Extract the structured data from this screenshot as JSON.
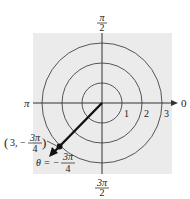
{
  "diagram": {
    "type": "polar-coordinate-plot",
    "background_color": "#ebebeb",
    "axis_color": "#333333",
    "circle_color": "#555555",
    "ray_color": "#111111",
    "center": {
      "x": 102,
      "y": 103
    },
    "unit_px": 20,
    "circles": [
      1,
      2,
      3
    ],
    "radial_labels": [
      "1",
      "2",
      "3"
    ],
    "angle_labels": {
      "right": "0",
      "left": "π",
      "top_num": "π",
      "top_den": "2",
      "bottom_num": "3π",
      "bottom_den": "2"
    },
    "point": {
      "r": 3,
      "theta_label": "-3π/4",
      "label_prefix": "(3, −",
      "label_num": "3π",
      "label_den": "4",
      "label_suffix": ")"
    },
    "theta_annotation": {
      "prefix": "θ = −",
      "num": "3π",
      "den": "4"
    }
  }
}
